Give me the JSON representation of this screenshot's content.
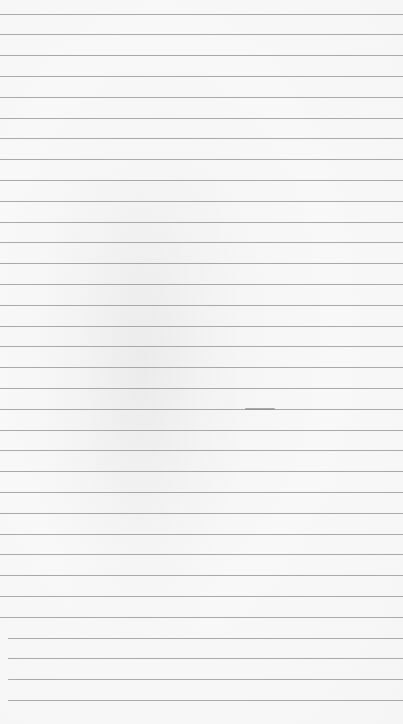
{
  "paper": {
    "background_color": "#f6f6f6",
    "line_color": "#a9a9a9",
    "first_line_y": 13.5,
    "line_spacing": 20.8,
    "line_count": 34,
    "mark": {
      "x": 245,
      "y": 408.5,
      "width": 30
    }
  }
}
